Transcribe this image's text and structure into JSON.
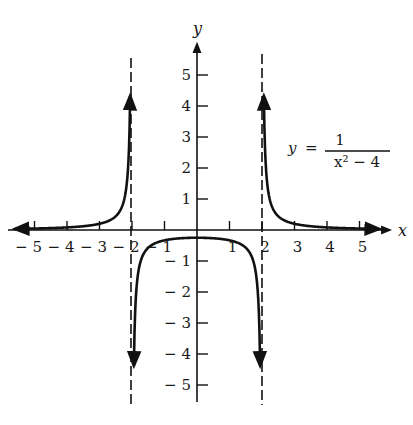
{
  "chart_data": {
    "type": "line",
    "title": "",
    "function": "y = 1/(x^2 - 4)",
    "equation_label": {
      "lhs": "y",
      "equals": "=",
      "numerator": "1",
      "denominator": "x² − 4"
    },
    "xlabel": "x",
    "ylabel": "y",
    "xlim": [
      -5.6,
      5.9
    ],
    "ylim": [
      -5.6,
      5.6
    ],
    "grid": false,
    "x_ticks": [
      -5,
      -4,
      -3,
      -2,
      -1,
      1,
      2,
      3,
      4,
      5
    ],
    "x_tick_labels": [
      "− 5",
      "− 4",
      "− 3",
      "− 2",
      "− 1",
      "1",
      "2",
      "3",
      "4",
      "5"
    ],
    "y_ticks": [
      5,
      4,
      3,
      2,
      1,
      -1,
      -2,
      -3,
      -4,
      -5
    ],
    "y_tick_labels": [
      "5",
      "4",
      "3",
      "2",
      "1",
      "− 1",
      "− 2",
      "− 3",
      "− 4",
      "− 5"
    ],
    "vertical_asymptotes": [
      -2,
      2
    ],
    "horizontal_asymptote": 0,
    "series": [
      {
        "name": "left branch (x < -2)",
        "x": [
          -5.6,
          -5,
          -4,
          -3,
          -2.5,
          -2.2,
          -2.1,
          -2.05
        ],
        "y": [
          0.036,
          0.048,
          0.083,
          0.2,
          0.444,
          1.19,
          2.44,
          4.94
        ]
      },
      {
        "name": "middle branch (-2 < x < 2)",
        "x": [
          -1.97,
          -1.9,
          -1.5,
          -1,
          0,
          1,
          1.5,
          1.9,
          1.97
        ],
        "y": [
          -8.4,
          -2.56,
          -0.571,
          -0.333,
          -0.25,
          -0.333,
          -0.571,
          -2.56,
          -8.4
        ]
      },
      {
        "name": "right branch (x > 2)",
        "x": [
          2.05,
          2.1,
          2.2,
          2.5,
          3,
          4,
          5,
          5.6
        ],
        "y": [
          4.94,
          2.44,
          1.19,
          0.444,
          0.2,
          0.083,
          0.048,
          0.036
        ]
      }
    ],
    "annotations": [
      "y = 1/(x² − 4)"
    ]
  }
}
